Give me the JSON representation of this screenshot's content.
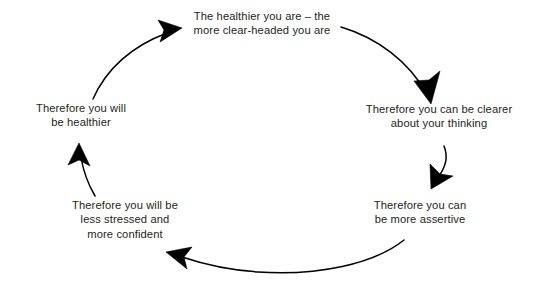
{
  "diagram": {
    "type": "cycle",
    "direction": "clockwise",
    "background_color": "#ffffff",
    "stroke_color": "#000000",
    "text_color": "#231f20",
    "nodes": [
      {
        "id": "healthier-clear-headed",
        "position": "top",
        "text": "The healthier you are – the\nmore clear-headed you are"
      },
      {
        "id": "clearer-thinking",
        "position": "right",
        "text": "Therefore you can be clearer\nabout your thinking"
      },
      {
        "id": "more-assertive",
        "position": "bottom-right",
        "text": "Therefore you can\nbe more assertive"
      },
      {
        "id": "less-stressed-more-confident",
        "position": "bottom-left",
        "text": "Therefore you will be\nless stressed and\nmore confident"
      },
      {
        "id": "will-be-healthier",
        "position": "left",
        "text": "Therefore you will\nbe healthier"
      }
    ],
    "arrows": [
      {
        "id": "arrow-top-to-right",
        "from": "healthier-clear-headed",
        "to": "clearer-thinking"
      },
      {
        "id": "arrow-right-to-bottomright",
        "from": "clearer-thinking",
        "to": "more-assertive"
      },
      {
        "id": "arrow-bottomright-to-bottomleft",
        "from": "more-assertive",
        "to": "less-stressed-more-confident"
      },
      {
        "id": "arrow-bottomleft-to-left",
        "from": "less-stressed-more-confident",
        "to": "will-be-healthier"
      },
      {
        "id": "arrow-left-to-top",
        "from": "will-be-healthier",
        "to": "healthier-clear-headed"
      }
    ]
  }
}
